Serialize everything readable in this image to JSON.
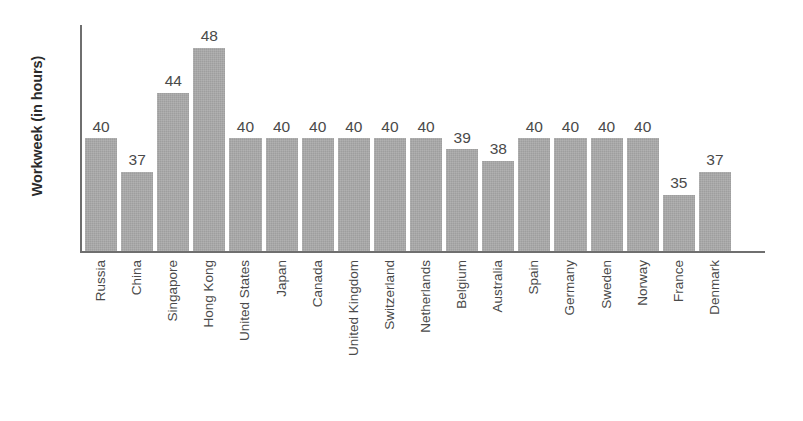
{
  "chart_data": {
    "type": "bar",
    "title": "",
    "subtitle": "",
    "xlabel": "",
    "ylabel": "Workweek (in hours)",
    "categories": [
      "Russia",
      "China",
      "Singapore",
      "Hong Kong",
      "United States",
      "Japan",
      "Canada",
      "United Kingdom",
      "Switzerland",
      "Netherlands",
      "Belgium",
      "Australia",
      "Spain",
      "Germany",
      "Sweden",
      "Norway",
      "France",
      "Denmark"
    ],
    "values": [
      40,
      37,
      44,
      48,
      40,
      40,
      40,
      40,
      40,
      40,
      39,
      38,
      40,
      40,
      40,
      40,
      35,
      37
    ],
    "value_labels": [
      "40",
      "37",
      "44",
      "48",
      "40",
      "40",
      "40",
      "40",
      "40",
      "40",
      "39",
      "38",
      "40",
      "40",
      "40",
      "40",
      "35",
      "37"
    ],
    "ylim": [
      30,
      50
    ],
    "grid": false,
    "legend": null,
    "bar_color": "#9e9e9e",
    "axis_color": "#6f6f6f",
    "text_color": "#4a4a4a",
    "background_color": "#ffffff",
    "tick_labels_y": [],
    "annotations": []
  }
}
